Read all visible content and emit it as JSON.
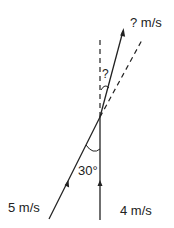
{
  "diagram": {
    "labels": {
      "resultant_speed": "? m/s",
      "unknown_angle": "?",
      "given_angle": "30°",
      "velocity_a": "5 m/s",
      "velocity_b": "4 m/s"
    },
    "colors": {
      "line": "#222222",
      "background": "#ffffff"
    },
    "vectors": [
      {
        "name": "velocity-a",
        "magnitude": "5 m/s",
        "angle_from_vertical_deg": 30
      },
      {
        "name": "velocity-b",
        "magnitude": "4 m/s",
        "direction": "vertical"
      },
      {
        "name": "resultant",
        "magnitude": "? m/s",
        "angle_from_vertical": "?"
      }
    ]
  }
}
